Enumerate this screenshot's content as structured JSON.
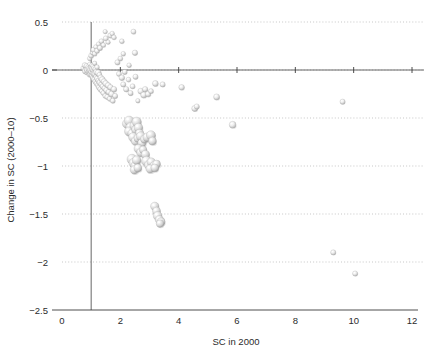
{
  "chart_data": {
    "type": "scatter",
    "title": "",
    "xlabel": "SC in 2000",
    "ylabel": "Change in SC (2000–10)",
    "xlim": [
      0,
      12
    ],
    "ylim": [
      -2.5,
      0.5
    ],
    "xticks": [
      0,
      2,
      4,
      6,
      8,
      10,
      12
    ],
    "xtick_labels": [
      "0",
      "2",
      "4",
      "6",
      "8",
      "10",
      "12"
    ],
    "yticks": [
      0.5,
      0,
      -0.5,
      -1,
      -1.5,
      -2,
      -2.5
    ],
    "ytick_labels": [
      "0.5",
      "0",
      "−0.5",
      "−1",
      "−1.5",
      "−2",
      "−2.5"
    ],
    "grid": "horizontal-dotted",
    "legend": "none",
    "marker_style": "3d-shaded-sphere",
    "marker_color": "#d8d8d8",
    "reference_lines": [
      {
        "axis": "x",
        "value": 1,
        "label": "SC = 1"
      },
      {
        "axis": "y",
        "value": 0,
        "label": "no change"
      }
    ],
    "points": [
      {
        "x": 0.72,
        "y": 0.02,
        "r": 2.2
      },
      {
        "x": 0.78,
        "y": 0.05,
        "r": 2.6
      },
      {
        "x": 0.8,
        "y": -0.01,
        "r": 3.0
      },
      {
        "x": 0.83,
        "y": 0.01,
        "r": 2.4
      },
      {
        "x": 0.85,
        "y": 0.04,
        "r": 2.8
      },
      {
        "x": 0.86,
        "y": -0.03,
        "r": 2.2
      },
      {
        "x": 0.88,
        "y": 0.0,
        "r": 3.2
      },
      {
        "x": 0.9,
        "y": 0.03,
        "r": 2.6
      },
      {
        "x": 0.91,
        "y": -0.02,
        "r": 2.4
      },
      {
        "x": 0.93,
        "y": 0.01,
        "r": 3.0
      },
      {
        "x": 0.94,
        "y": -0.05,
        "r": 2.3
      },
      {
        "x": 0.95,
        "y": 0.06,
        "r": 2.1
      },
      {
        "x": 0.96,
        "y": -0.01,
        "r": 2.9
      },
      {
        "x": 0.97,
        "y": 0.02,
        "r": 2.5
      },
      {
        "x": 0.98,
        "y": -0.04,
        "r": 2.7
      },
      {
        "x": 0.99,
        "y": 0.0,
        "r": 3.1
      },
      {
        "x": 1.0,
        "y": 0.03,
        "r": 2.4
      },
      {
        "x": 1.01,
        "y": -0.02,
        "r": 2.8
      },
      {
        "x": 1.02,
        "y": 0.05,
        "r": 2.2
      },
      {
        "x": 1.03,
        "y": -0.06,
        "r": 2.6
      },
      {
        "x": 1.04,
        "y": 0.01,
        "r": 3.0
      },
      {
        "x": 1.05,
        "y": -0.03,
        "r": 2.5
      },
      {
        "x": 1.06,
        "y": 0.04,
        "r": 2.3
      },
      {
        "x": 1.07,
        "y": -0.08,
        "r": 2.7
      },
      {
        "x": 1.08,
        "y": 0.0,
        "r": 2.9
      },
      {
        "x": 1.09,
        "y": -0.05,
        "r": 2.4
      },
      {
        "x": 1.1,
        "y": 0.02,
        "r": 2.6
      },
      {
        "x": 1.11,
        "y": -0.1,
        "r": 2.8
      },
      {
        "x": 1.12,
        "y": 0.07,
        "r": 2.2
      },
      {
        "x": 1.13,
        "y": -0.04,
        "r": 3.0
      },
      {
        "x": 1.14,
        "y": -0.12,
        "r": 2.5
      },
      {
        "x": 1.15,
        "y": 0.01,
        "r": 2.7
      },
      {
        "x": 1.16,
        "y": -0.07,
        "r": 2.3
      },
      {
        "x": 1.18,
        "y": -0.02,
        "r": 2.9
      },
      {
        "x": 1.19,
        "y": -0.14,
        "r": 2.6
      },
      {
        "x": 1.2,
        "y": 0.03,
        "r": 2.4
      },
      {
        "x": 1.21,
        "y": -0.09,
        "r": 2.8
      },
      {
        "x": 1.23,
        "y": -0.16,
        "r": 2.5
      },
      {
        "x": 1.24,
        "y": -0.03,
        "r": 3.1
      },
      {
        "x": 1.25,
        "y": -0.11,
        "r": 2.6
      },
      {
        "x": 1.27,
        "y": -0.18,
        "r": 2.7
      },
      {
        "x": 1.28,
        "y": -0.05,
        "r": 2.4
      },
      {
        "x": 1.3,
        "y": -0.13,
        "r": 2.9
      },
      {
        "x": 1.31,
        "y": -0.2,
        "r": 2.5
      },
      {
        "x": 1.33,
        "y": -0.08,
        "r": 2.8
      },
      {
        "x": 1.35,
        "y": -0.15,
        "r": 2.6
      },
      {
        "x": 1.36,
        "y": -0.22,
        "r": 2.3
      },
      {
        "x": 1.38,
        "y": -0.1,
        "r": 3.0
      },
      {
        "x": 1.4,
        "y": -0.17,
        "r": 2.7
      },
      {
        "x": 1.42,
        "y": -0.24,
        "r": 2.5
      },
      {
        "x": 1.44,
        "y": -0.12,
        "r": 2.8
      },
      {
        "x": 1.46,
        "y": -0.19,
        "r": 2.6
      },
      {
        "x": 1.48,
        "y": -0.27,
        "r": 2.4
      },
      {
        "x": 1.5,
        "y": -0.14,
        "r": 2.9
      },
      {
        "x": 1.52,
        "y": -0.21,
        "r": 2.7
      },
      {
        "x": 1.55,
        "y": -0.28,
        "r": 2.5
      },
      {
        "x": 1.58,
        "y": -0.16,
        "r": 2.8
      },
      {
        "x": 1.6,
        "y": -0.23,
        "r": 2.6
      },
      {
        "x": 1.63,
        "y": -0.3,
        "r": 2.4
      },
      {
        "x": 1.66,
        "y": -0.18,
        "r": 2.7
      },
      {
        "x": 1.7,
        "y": -0.25,
        "r": 2.9
      },
      {
        "x": 1.74,
        "y": -0.32,
        "r": 2.5
      },
      {
        "x": 1.78,
        "y": -0.2,
        "r": 2.8
      },
      {
        "x": 1.82,
        "y": -0.27,
        "r": 2.6
      },
      {
        "x": 0.95,
        "y": 0.12,
        "r": 2.3
      },
      {
        "x": 1.0,
        "y": 0.15,
        "r": 2.5
      },
      {
        "x": 1.04,
        "y": 0.18,
        "r": 2.2
      },
      {
        "x": 1.08,
        "y": 0.21,
        "r": 2.6
      },
      {
        "x": 1.12,
        "y": 0.17,
        "r": 2.4
      },
      {
        "x": 1.16,
        "y": 0.24,
        "r": 2.3
      },
      {
        "x": 1.2,
        "y": 0.2,
        "r": 2.5
      },
      {
        "x": 1.25,
        "y": 0.27,
        "r": 2.2
      },
      {
        "x": 1.3,
        "y": 0.23,
        "r": 2.6
      },
      {
        "x": 1.35,
        "y": 0.3,
        "r": 2.4
      },
      {
        "x": 1.42,
        "y": 0.26,
        "r": 2.3
      },
      {
        "x": 1.5,
        "y": 0.33,
        "r": 2.5
      },
      {
        "x": 1.58,
        "y": 0.29,
        "r": 2.2
      },
      {
        "x": 1.66,
        "y": 0.36,
        "r": 2.6
      },
      {
        "x": 1.72,
        "y": 0.38,
        "r": 2.3
      },
      {
        "x": 1.78,
        "y": 0.34,
        "r": 2.4
      },
      {
        "x": 1.48,
        "y": 0.4,
        "r": 2.2
      },
      {
        "x": 1.9,
        "y": 0.08,
        "r": 2.6
      },
      {
        "x": 1.95,
        "y": -0.04,
        "r": 2.5
      },
      {
        "x": 2.0,
        "y": 0.12,
        "r": 2.4
      },
      {
        "x": 2.05,
        "y": -0.08,
        "r": 2.8
      },
      {
        "x": 2.1,
        "y": -0.15,
        "r": 2.6
      },
      {
        "x": 2.15,
        "y": -0.02,
        "r": 2.5
      },
      {
        "x": 2.2,
        "y": -0.2,
        "r": 2.7
      },
      {
        "x": 2.28,
        "y": -0.1,
        "r": 2.4
      },
      {
        "x": 2.35,
        "y": -0.24,
        "r": 2.6
      },
      {
        "x": 2.42,
        "y": -0.17,
        "r": 2.5
      },
      {
        "x": 2.1,
        "y": 0.17,
        "r": 2.3
      },
      {
        "x": 2.45,
        "y": 0.4,
        "r": 2.5
      },
      {
        "x": 2.5,
        "y": 0.18,
        "r": 2.7
      },
      {
        "x": 2.05,
        "y": 0.3,
        "r": 2.4
      },
      {
        "x": 2.3,
        "y": 0.05,
        "r": 2.3
      },
      {
        "x": 2.52,
        "y": -0.07,
        "r": 2.6
      },
      {
        "x": 2.6,
        "y": -0.32,
        "r": 2.2
      },
      {
        "x": 2.7,
        "y": -0.22,
        "r": 2.9
      },
      {
        "x": 2.8,
        "y": -0.26,
        "r": 3.0
      },
      {
        "x": 2.85,
        "y": -0.2,
        "r": 2.7
      },
      {
        "x": 2.95,
        "y": -0.25,
        "r": 2.8
      },
      {
        "x": 3.05,
        "y": -0.22,
        "r": 2.5
      },
      {
        "x": 3.2,
        "y": -0.14,
        "r": 2.9
      },
      {
        "x": 3.45,
        "y": -0.15,
        "r": 2.6
      },
      {
        "x": 4.1,
        "y": -0.18,
        "r": 2.8
      },
      {
        "x": 4.55,
        "y": -0.4,
        "r": 3.0
      },
      {
        "x": 4.62,
        "y": -0.38,
        "r": 2.6
      },
      {
        "x": 5.3,
        "y": -0.28,
        "r": 3.0
      },
      {
        "x": 5.85,
        "y": -0.57,
        "r": 3.4
      },
      {
        "x": 9.62,
        "y": -0.33,
        "r": 2.6
      },
      {
        "x": 2.22,
        "y": -0.56,
        "r": 4.4
      },
      {
        "x": 2.3,
        "y": -0.53,
        "r": 4.8
      },
      {
        "x": 2.36,
        "y": -0.6,
        "r": 5.0
      },
      {
        "x": 2.3,
        "y": -0.64,
        "r": 4.6
      },
      {
        "x": 2.4,
        "y": -0.66,
        "r": 4.2
      },
      {
        "x": 2.48,
        "y": -0.58,
        "r": 4.5
      },
      {
        "x": 2.52,
        "y": -0.62,
        "r": 4.0
      },
      {
        "x": 2.56,
        "y": -0.54,
        "r": 4.7
      },
      {
        "x": 2.62,
        "y": -0.6,
        "r": 4.4
      },
      {
        "x": 2.66,
        "y": -0.66,
        "r": 4.1
      },
      {
        "x": 2.44,
        "y": -0.7,
        "r": 4.6
      },
      {
        "x": 2.52,
        "y": -0.74,
        "r": 4.3
      },
      {
        "x": 2.6,
        "y": -0.71,
        "r": 4.0
      },
      {
        "x": 2.7,
        "y": -0.69,
        "r": 4.5
      },
      {
        "x": 2.74,
        "y": -0.76,
        "r": 4.2
      },
      {
        "x": 2.82,
        "y": -0.72,
        "r": 3.9
      },
      {
        "x": 2.92,
        "y": -0.7,
        "r": 4.3
      },
      {
        "x": 3.05,
        "y": -0.68,
        "r": 4.6
      },
      {
        "x": 3.1,
        "y": -0.74,
        "r": 4.0
      },
      {
        "x": 2.62,
        "y": -0.82,
        "r": 4.4
      },
      {
        "x": 2.7,
        "y": -0.86,
        "r": 4.1
      },
      {
        "x": 2.78,
        "y": -0.83,
        "r": 3.8
      },
      {
        "x": 2.86,
        "y": -0.88,
        "r": 4.2
      },
      {
        "x": 2.4,
        "y": -0.93,
        "r": 5.0
      },
      {
        "x": 2.46,
        "y": -0.97,
        "r": 4.8
      },
      {
        "x": 2.52,
        "y": -1.0,
        "r": 4.6
      },
      {
        "x": 2.56,
        "y": -0.94,
        "r": 4.4
      },
      {
        "x": 2.48,
        "y": -1.04,
        "r": 4.2
      },
      {
        "x": 2.6,
        "y": -1.02,
        "r": 4.0
      },
      {
        "x": 2.9,
        "y": -0.95,
        "r": 5.0
      },
      {
        "x": 2.98,
        "y": -0.99,
        "r": 4.6
      },
      {
        "x": 3.06,
        "y": -0.96,
        "r": 4.3
      },
      {
        "x": 3.16,
        "y": -1.0,
        "r": 4.4
      },
      {
        "x": 3.24,
        "y": -0.98,
        "r": 4.0
      },
      {
        "x": 3.02,
        "y": -1.03,
        "r": 4.2
      },
      {
        "x": 3.18,
        "y": -1.02,
        "r": 3.9
      },
      {
        "x": 3.18,
        "y": -1.42,
        "r": 4.2
      },
      {
        "x": 3.24,
        "y": -1.47,
        "r": 4.0
      },
      {
        "x": 3.28,
        "y": -1.52,
        "r": 4.4
      },
      {
        "x": 3.34,
        "y": -1.56,
        "r": 4.2
      },
      {
        "x": 3.4,
        "y": -1.58,
        "r": 4.0
      },
      {
        "x": 3.36,
        "y": -1.6,
        "r": 3.8
      },
      {
        "x": 9.3,
        "y": -1.9,
        "r": 2.6
      },
      {
        "x": 10.05,
        "y": -2.12,
        "r": 2.6
      }
    ]
  },
  "figure": {
    "background_color": "#ffffff",
    "axis_color": "#3a3a3a",
    "grid_color": "#b9b9b9"
  }
}
